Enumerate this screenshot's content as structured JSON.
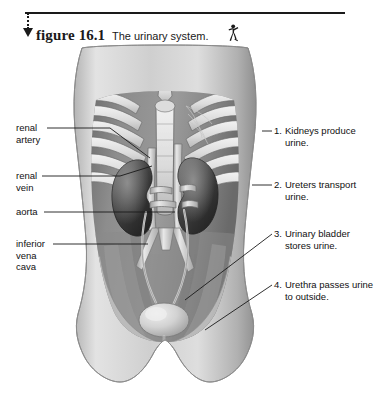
{
  "figure": {
    "label": "figure",
    "number": "16.1",
    "title": "The urinary system.",
    "icon": "running-human-figure-icon",
    "marker": "down-arrow-marker"
  },
  "illustration": {
    "name": "urinary-system-anatomical-illustration",
    "description": "Grayscale anterior view of human torso showing rib cage, kidneys, ureters, aorta, inferior vena cava, urinary bladder and urethra",
    "colors": {
      "skin": "#c9c9c9",
      "abdomen": "#8d8d8d",
      "bone": "#e4e4e4",
      "kidney": "#4a4a4a",
      "vessel_light": "#d8d8d8",
      "bladder": "#d9d9d9",
      "outline": "#3a3a3a"
    }
  },
  "labels_left": [
    {
      "id": "renal-artery",
      "lines": [
        "renal",
        "artery"
      ]
    },
    {
      "id": "renal-vein",
      "lines": [
        "renal",
        "vein"
      ]
    },
    {
      "id": "aorta",
      "lines": [
        "aorta"
      ]
    },
    {
      "id": "inferior-vena-cava",
      "lines": [
        "inferior",
        "vena",
        "cava"
      ]
    }
  ],
  "labels_right": [
    {
      "id": "kidneys",
      "number": "1.",
      "text": "Kidneys produce urine."
    },
    {
      "id": "ureters",
      "number": "2.",
      "text": "Ureters transport urine."
    },
    {
      "id": "urinary-bladder",
      "number": "3.",
      "text": "Urinary bladder stores urine."
    },
    {
      "id": "urethra",
      "number": "4.",
      "text": "Urethra passes urine to outside."
    }
  ]
}
